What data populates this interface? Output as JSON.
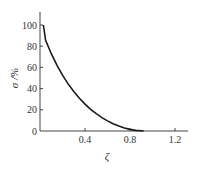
{
  "chart_data": {
    "type": "line",
    "title": "",
    "xlabel": "ζ",
    "ylabel": "σ /%",
    "xlim": [
      0,
      1.3
    ],
    "ylim": [
      0,
      108
    ],
    "xticks": [
      0.4,
      0.8,
      1.2
    ],
    "xtick_labels": [
      "0.4",
      "0.8",
      "1.2"
    ],
    "yticks": [
      0,
      20,
      40,
      60,
      80,
      100
    ],
    "ytick_labels": [
      "0",
      "20",
      "40",
      "60",
      "80",
      "100"
    ],
    "grid": false,
    "legend": null,
    "series": [
      {
        "name": "overshoot",
        "color": "#1a1a1a",
        "x": [
          0.05,
          0.1,
          0.15,
          0.2,
          0.25,
          0.3,
          0.35,
          0.4,
          0.45,
          0.5,
          0.55,
          0.6,
          0.65,
          0.7,
          0.75,
          0.8,
          0.85,
          0.9,
          0.92
        ],
        "y": [
          85.5,
          72.9,
          62.1,
          52.7,
          44.4,
          37.2,
          30.9,
          25.4,
          20.5,
          16.3,
          12.6,
          9.5,
          6.8,
          4.6,
          2.8,
          1.5,
          0.6,
          0.2,
          0.1
        ]
      }
    ]
  }
}
